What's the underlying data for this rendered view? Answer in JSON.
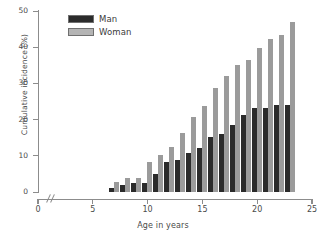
{
  "chart_data": {
    "type": "bar",
    "title": "",
    "xlabel": "Age in years",
    "ylabel": "Cumulative incidence (%)",
    "categories": [
      7,
      8,
      9,
      10,
      11,
      12,
      13,
      14,
      15,
      16,
      17,
      18,
      19,
      20,
      21,
      22,
      23
    ],
    "series": [
      {
        "name": "Man",
        "color": "#2b2b2b",
        "values": [
          1.1,
          1.8,
          2.6,
          2.6,
          4.9,
          8.2,
          8.9,
          10.7,
          12.2,
          15.3,
          16.1,
          18.5,
          21.2,
          23.1,
          23.2,
          23.9,
          24.1
        ]
      },
      {
        "name": "Woman",
        "color": "#9b9b9b",
        "values": [
          2.7,
          3.9,
          3.9,
          8.4,
          10.1,
          12.5,
          16.4,
          20.8,
          23.8,
          28.8,
          32.1,
          35.2,
          36.4,
          39.9,
          42.4,
          43.5,
          46.9
        ]
      }
    ],
    "ylim": [
      0,
      50
    ],
    "yticks": [
      0,
      10,
      20,
      30,
      40,
      50
    ],
    "ytick_labels": [
      "0",
      "10",
      "20",
      "30",
      "40",
      "50"
    ],
    "xlim": [
      0,
      25
    ],
    "xticks": [
      0,
      5,
      10,
      15,
      20,
      25
    ],
    "xtick_labels": [
      "0",
      "5",
      "10",
      "15",
      "20",
      "25"
    ],
    "x_axis_break": true,
    "grid": false,
    "legend_position": "top-left",
    "legend": [
      "Man",
      "Woman"
    ]
  }
}
